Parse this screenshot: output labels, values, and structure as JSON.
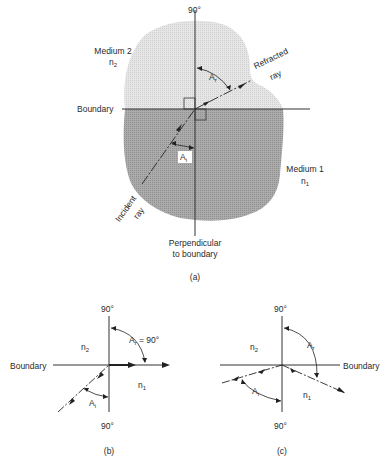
{
  "panel_a": {
    "top_angle_label": "90°",
    "medium2_label": "Medium 2",
    "medium2_index": "n",
    "medium2_index_sub": "2",
    "refracted_label_1": "Refracted",
    "refracted_label_2": "ray",
    "boundary_label": "Boundary",
    "angle_refraction": "A",
    "angle_refraction_sub": "r",
    "angle_incidence": "A",
    "angle_incidence_sub": "i",
    "medium1_label": "Medium 1",
    "medium1_index": "n",
    "medium1_index_sub": "1",
    "incident_label_1": "Incident",
    "incident_label_2": "ray",
    "perpendicular_label_1": "Perpendicular",
    "perpendicular_label_2": "to boundary",
    "caption": "(a)",
    "colors": {
      "medium2_fill": "#e2e2e2",
      "medium1_fill": "#a6a6a6",
      "line": "#333333"
    }
  },
  "panel_b": {
    "top_angle_label": "90°",
    "bottom_angle_label": "90°",
    "boundary_label": "Boundary",
    "n2": "n",
    "n2_sub": "2",
    "n1": "n",
    "n1_sub": "1",
    "angle_refraction": "A",
    "angle_refraction_sub": "r",
    "angle_refraction_value": "= 90°",
    "angle_incidence": "A",
    "angle_incidence_sub": "i",
    "caption": "(b)"
  },
  "panel_c": {
    "top_angle_label": "90°",
    "bottom_angle_label": "90°",
    "boundary_label": "Boundary",
    "n2": "n",
    "n2_sub": "2",
    "n1": "n",
    "n1_sub": "1",
    "angle_refraction": "A",
    "angle_refraction_sub": "r",
    "angle_incidence": "A",
    "angle_incidence_sub": "i",
    "caption": "(c)"
  }
}
